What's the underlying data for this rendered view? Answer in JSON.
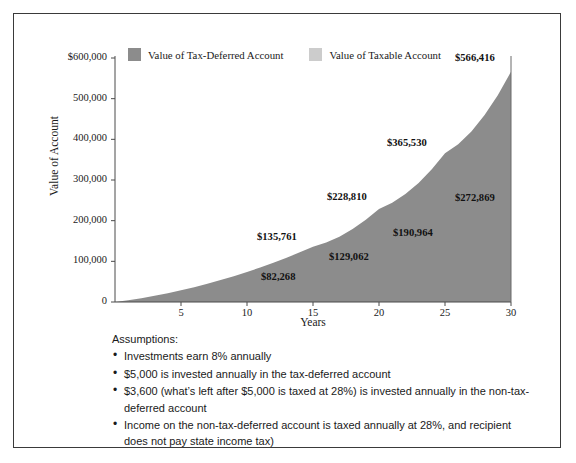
{
  "frame": {
    "border_color": "#3a3a3a",
    "background": "#ffffff"
  },
  "legend": {
    "position": "top",
    "entries": [
      {
        "label": "Value of Tax-Deferred Account",
        "color": "#8c8c8c",
        "swatch_name": "legend-swatch-tax-deferred"
      },
      {
        "label": "Value of Taxable Account",
        "color": "#cccccc",
        "swatch_name": "legend-swatch-taxable"
      }
    ]
  },
  "chart_data": {
    "type": "area",
    "title": "",
    "subtitle": "",
    "xlabel": "Years",
    "ylabel": "Value of Account",
    "xlim": [
      0,
      30
    ],
    "ylim": [
      0,
      600000
    ],
    "grid": false,
    "legend_position": "top",
    "x_ticks": [
      5,
      10,
      15,
      20,
      25,
      30
    ],
    "x_tick_labels": [
      "5",
      "10",
      "15",
      "20",
      "25",
      "30"
    ],
    "y_ticks": [
      0,
      100000,
      200000,
      300000,
      400000,
      500000,
      600000
    ],
    "y_tick_labels": [
      "0",
      "100,000",
      "200,000",
      "300,000",
      "400,000",
      "500,000",
      "$600,000"
    ],
    "x": [
      0,
      1,
      2,
      3,
      4,
      5,
      6,
      7,
      8,
      9,
      10,
      11,
      12,
      13,
      14,
      15,
      16,
      17,
      18,
      19,
      20,
      21,
      22,
      23,
      24,
      25,
      26,
      27,
      28,
      29,
      30
    ],
    "series": [
      {
        "name": "Value of Tax-Deferred Account",
        "color": "#8c8c8c",
        "values": [
          0,
          5400,
          11232,
          17531,
          24333,
          31680,
          39614,
          48183,
          57438,
          67433,
          78227,
          89885,
          102476,
          116074,
          130760,
          135761,
          163651,
          182143,
          202115,
          223685,
          228810,
          272056,
          299221,
          328558,
          360243,
          365530,
          431968,
          471925,
          515079,
          561686,
          566416
        ],
        "labels": [
          {
            "x": 15,
            "value": 135761,
            "text": "$135,761"
          },
          {
            "x": 20,
            "value": 228810,
            "text": "$228,810"
          },
          {
            "x": 25,
            "value": 365530,
            "text": "$365,530"
          },
          {
            "x": 30,
            "value": 566416,
            "text": "$566,416"
          }
        ]
      },
      {
        "name": "Value of Taxable Account",
        "color": "#cccccc",
        "values": [
          0,
          3807,
          7845,
          12129,
          16672,
          21491,
          26601,
          32021,
          37768,
          43862,
          50325,
          57178,
          64446,
          72154,
          80329,
          82268,
          98180,
          107972,
          118377,
          129062,
          129062,
          152113,
          165355,
          179421,
          194361,
          190964,
          226998,
          245198,
          264510,
          285000,
          272869
        ],
        "labels": [
          {
            "x": 15,
            "value": 82268,
            "text": "$82,268"
          },
          {
            "x": 20,
            "value": 129062,
            "text": "$129,062"
          },
          {
            "x": 25,
            "value": 190964,
            "text": "$190,964"
          },
          {
            "x": 30,
            "value": 272869,
            "text": "$272,869"
          }
        ]
      }
    ]
  },
  "assumptions": {
    "title": "Assumptions:",
    "bullet_glyph": "•",
    "items": [
      "Investments earn 8% annually",
      "$5,000 is invested annually in the tax-deferred account",
      "$3,600 (what’s left after $5,000 is taxed at 28%) is invested annually in the non-tax-deferred account",
      "Income on the non-tax-deferred account is taxed annually at 28%, and recipient does not pay state income tax)"
    ]
  }
}
